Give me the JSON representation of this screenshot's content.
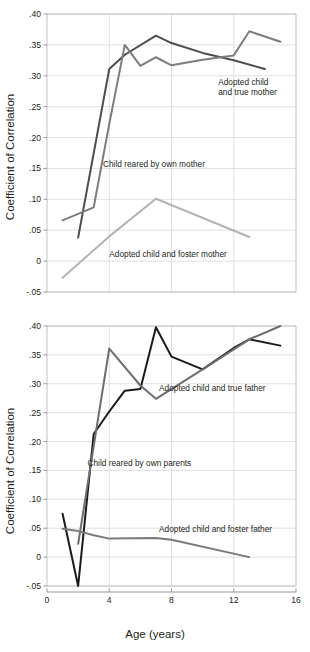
{
  "figure": {
    "width": 310,
    "height": 652,
    "background": "#ffffff"
  },
  "axis_titles": {
    "y": "Coefficient of Correlation",
    "x": "Age (years)"
  },
  "colors": {
    "own_parent_dark": "#4d4d4d",
    "true_parent_mid": "#7d7d7d",
    "foster_parent_light": "#b3b3b3",
    "own_parents_black": "#1a1a1a",
    "true_father_gray": "#6e6e6e",
    "foster_father_gray": "#7a7a7a",
    "grid": "#d8d8d8",
    "frame": "#bdbdbd",
    "text": "#231f20"
  },
  "chart_data": [
    {
      "id": "panel-mothers",
      "type": "line",
      "title": "",
      "xlabel": "",
      "ylabel": "Coefficient of Correlation",
      "xlim": [
        0,
        16
      ],
      "ylim": [
        -0.05,
        0.4
      ],
      "xticks": [
        0,
        4,
        8,
        12,
        16
      ],
      "xticklabels": [
        "0",
        "4",
        "8",
        "12",
        "16"
      ],
      "yticks": [
        -0.05,
        0,
        0.05,
        0.1,
        0.15,
        0.2,
        0.25,
        0.3,
        0.35,
        0.4
      ],
      "yticklabels": [
        "-.05",
        "0",
        ".05",
        ".10",
        ".15",
        ".20",
        ".25",
        ".30",
        ".35",
        ".40"
      ],
      "grid": true,
      "legend": "inline-annotations",
      "series": [
        {
          "name": "Child reared by own mother",
          "color": "#4d4d4d",
          "width": 2.0,
          "x": [
            2,
            4,
            5,
            7,
            8,
            10,
            12,
            14
          ],
          "y": [
            0.038,
            0.311,
            0.334,
            0.365,
            0.353,
            0.337,
            0.325,
            0.311
          ]
        },
        {
          "name": "Adopted child and true mother",
          "color": "#7d7d7d",
          "width": 2.0,
          "x": [
            1,
            3,
            4,
            5,
            6,
            7,
            8,
            10,
            12,
            13,
            15
          ],
          "y": [
            0.066,
            0.087,
            0.222,
            0.35,
            0.316,
            0.33,
            0.317,
            0.326,
            0.333,
            0.372,
            0.355
          ]
        },
        {
          "name": "Adopted child and foster mother",
          "color": "#b3b3b3",
          "width": 2.0,
          "x": [
            1,
            4,
            7,
            13
          ],
          "y": [
            -0.027,
            0.04,
            0.101,
            0.039
          ]
        }
      ],
      "annotations": [
        {
          "text_lines": [
            "Adopted child",
            "and true mother"
          ],
          "x": 11.0,
          "y": 0.285,
          "align": "start"
        },
        {
          "text_lines": [
            "Child reared by own mother"
          ],
          "x": 3.6,
          "y": 0.152,
          "align": "start"
        },
        {
          "text_lines": [
            "Adopted child and foster mother"
          ],
          "x": 4.0,
          "y": 0.007,
          "align": "start"
        }
      ]
    },
    {
      "id": "panel-fathers",
      "type": "line",
      "title": "",
      "xlabel": "Age (years)",
      "ylabel": "Coefficient of Correlation",
      "xlim": [
        0,
        16
      ],
      "ylim": [
        -0.05,
        0.4
      ],
      "xticks": [
        0,
        4,
        8,
        12,
        16
      ],
      "xticklabels": [
        "0",
        "4",
        "8",
        "12",
        "16"
      ],
      "yticks": [
        -0.05,
        0,
        0.05,
        0.1,
        0.15,
        0.2,
        0.25,
        0.3,
        0.35,
        0.4
      ],
      "yticklabels": [
        "-.05",
        "0",
        ".05",
        ".10",
        ".15",
        ".20",
        ".25",
        ".30",
        ".35",
        ".40"
      ],
      "grid": true,
      "legend": "inline-annotations",
      "series": [
        {
          "name": "Child reared by own parents",
          "color": "#1a1a1a",
          "width": 2.0,
          "x": [
            1,
            2,
            3,
            4,
            5,
            6,
            7,
            8,
            10,
            12,
            13,
            15
          ],
          "y": [
            0.075,
            -0.05,
            0.213,
            0.252,
            0.288,
            0.291,
            0.398,
            0.347,
            0.325,
            0.362,
            0.377,
            0.366
          ]
        },
        {
          "name": "Adopted child and true father",
          "color": "#6e6e6e",
          "width": 2.0,
          "x": [
            2,
            4,
            6,
            7,
            10,
            13,
            15
          ],
          "y": [
            0.023,
            0.361,
            0.297,
            0.274,
            0.325,
            0.377,
            0.4
          ]
        },
        {
          "name": "Adopted child and foster father",
          "color": "#7a7a7a",
          "width": 2.0,
          "x": [
            1,
            2,
            3,
            4,
            7,
            8,
            13
          ],
          "y": [
            0.049,
            0.045,
            0.038,
            0.032,
            0.033,
            0.03,
            0.0
          ]
        }
      ],
      "annotations": [
        {
          "text_lines": [
            "Adopted child and true father"
          ],
          "x": 7.2,
          "y": 0.288,
          "align": "start"
        },
        {
          "text_lines": [
            "Child reared by own parents"
          ],
          "x": 2.6,
          "y": 0.158,
          "align": "start"
        },
        {
          "text_lines": [
            "Adopted child and foster father"
          ],
          "x": 7.2,
          "y": 0.043,
          "align": "start"
        }
      ]
    }
  ]
}
